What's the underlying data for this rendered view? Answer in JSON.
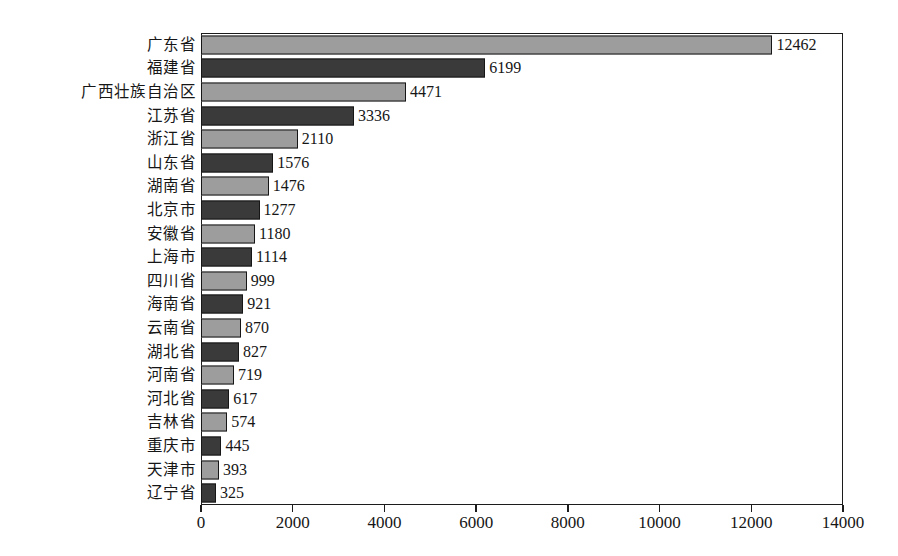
{
  "chart_data": {
    "type": "bar",
    "orientation": "horizontal",
    "title": "",
    "subtitle": "",
    "xlabel": "",
    "ylabel": "",
    "xlim": [
      0,
      14000
    ],
    "ylim": null,
    "grid": false,
    "legend": null,
    "legend_position": "none",
    "xticks": [
      0,
      2000,
      4000,
      6000,
      8000,
      10000,
      12000,
      14000
    ],
    "xtick_labels": [
      "0",
      "2000",
      "4000",
      "6000",
      "8000",
      "10000",
      "12000",
      "14000"
    ],
    "categories": [
      "广东省",
      "福建省",
      "广西壮族自治区",
      "江苏省",
      "浙江省",
      "山东省",
      "湖南省",
      "北京市",
      "安徽省",
      "上海市",
      "四川省",
      "海南省",
      "云南省",
      "湖北省",
      "河南省",
      "河北省",
      "吉林省",
      "重庆市",
      "天津市",
      "辽宁省"
    ],
    "values": [
      12462,
      6199,
      4471,
      3336,
      2110,
      1576,
      1476,
      1277,
      1180,
      1114,
      999,
      921,
      870,
      827,
      719,
      617,
      574,
      445,
      393,
      325
    ],
    "data_labels": [
      "12462",
      "6199",
      "4471",
      "3336",
      "2110",
      "1576",
      "1476",
      "1277",
      "1180",
      "1114",
      "999",
      "921",
      "870",
      "827",
      "719",
      "617",
      "574",
      "445",
      "393",
      "325"
    ],
    "bar_fill_pattern": [
      "light",
      "dark"
    ],
    "colors": {
      "bar_light": "#9d9d9d",
      "bar_dark": "#3a3a3a",
      "bar_edge": "#161616",
      "axis": "#1c1c1c",
      "text": "#161616",
      "background": "#ffffff"
    }
  }
}
